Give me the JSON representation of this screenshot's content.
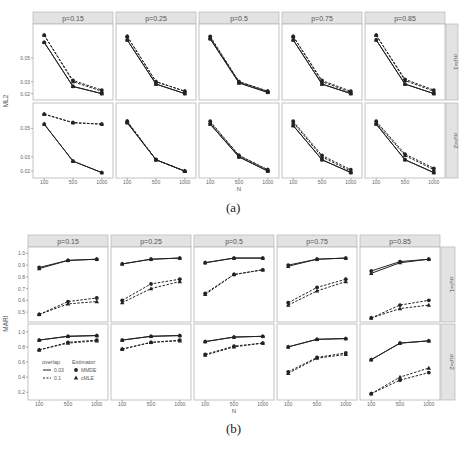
{
  "figure_a": {
    "caption": "(a)",
    "ylabel": "ML2",
    "xlabel": "N",
    "columns": [
      "p=0.15",
      "p=0.25",
      "p=0.5",
      "p=0.75",
      "p=0.85"
    ],
    "rows": [
      "σu²=1",
      "σu²=2"
    ],
    "x_ticks": [
      "100",
      "500",
      "1000"
    ],
    "row_yticks": [
      [
        "0.05",
        "0.03",
        "0.02"
      ],
      [
        "0.05",
        "0.03",
        "0.02"
      ]
    ]
  },
  "figure_b": {
    "caption": "(b)",
    "ylabel": "MARI",
    "xlabel": "N",
    "columns": [
      "p=0.15",
      "p=0.25",
      "p=0.5",
      "p=0.75",
      "p=0.85"
    ],
    "rows": [
      "σu²=1",
      "σu²=2"
    ],
    "x_ticks": [
      "100",
      "500",
      "1000"
    ],
    "row_yticks": [
      [
        "1.0",
        "0.9",
        "0.8",
        "0.7",
        "0.6",
        "0.5"
      ],
      [
        "1.0",
        "0.8",
        "0.6",
        "0.4",
        "0.2"
      ]
    ]
  },
  "legend": {
    "overlap_title": "overlap",
    "overlap_items": [
      {
        "label": "0.03",
        "style": "solid"
      },
      {
        "label": "0.1",
        "style": "dashed"
      }
    ],
    "estimator_title": "Estimator",
    "estimator_items": [
      {
        "label": "MMDE",
        "marker": "circle"
      },
      {
        "label": "cMLE",
        "marker": "triangle"
      }
    ]
  },
  "colors": {
    "strip_bg": "#e3e3e3",
    "strip_border": "#b5b5b5",
    "panel_border": "#b5b5b5",
    "line": "#222222",
    "text": "#444444"
  },
  "chart_data": [
    {
      "type": "line",
      "title": "(a)",
      "xlabel": "N",
      "ylabel": "ML2",
      "x": [
        100,
        500,
        1000
      ],
      "facets_columns": [
        "p=0.15",
        "p=0.25",
        "p=0.5",
        "p=0.75",
        "p=0.85"
      ],
      "facets_rows": [
        "σu²=1",
        "σu²=2"
      ],
      "legend": [
        "overlap 0.03 (solid)",
        "overlap 0.1 (dashed)",
        "MMDE (circle)",
        "cMLE (triangle)"
      ],
      "panels": [
        {
          "row": "σu²=1",
          "col": "p=0.15",
          "ylim": [
            0.018,
            0.075
          ],
          "series": [
            {
              "name": "0.03 MMDE",
              "values": [
                0.063,
                0.026,
                0.02
              ]
            },
            {
              "name": "0.03 cMLE",
              "values": [
                0.063,
                0.026,
                0.02
              ]
            },
            {
              "name": "0.1 MMDE",
              "values": [
                0.069,
                0.031,
                0.023
              ]
            },
            {
              "name": "0.1 cMLE",
              "values": [
                0.069,
                0.03,
                0.022
              ]
            }
          ]
        },
        {
          "row": "σu²=1",
          "col": "p=0.25",
          "ylim": [
            0.018,
            0.075
          ],
          "series": [
            {
              "name": "0.03 MMDE",
              "values": [
                0.065,
                0.028,
                0.02
              ]
            },
            {
              "name": "0.03 cMLE",
              "values": [
                0.065,
                0.028,
                0.02
              ]
            },
            {
              "name": "0.1 MMDE",
              "values": [
                0.068,
                0.03,
                0.022
              ]
            },
            {
              "name": "0.1 cMLE",
              "values": [
                0.068,
                0.03,
                0.022
              ]
            }
          ]
        },
        {
          "row": "σu²=1",
          "col": "p=0.5",
          "ylim": [
            0.018,
            0.075
          ],
          "series": [
            {
              "name": "0.03 MMDE",
              "values": [
                0.066,
                0.029,
                0.021
              ]
            },
            {
              "name": "0.03 cMLE",
              "values": [
                0.066,
                0.029,
                0.021
              ]
            },
            {
              "name": "0.1 MMDE",
              "values": [
                0.068,
                0.03,
                0.022
              ]
            },
            {
              "name": "0.1 cMLE",
              "values": [
                0.067,
                0.03,
                0.022
              ]
            }
          ]
        },
        {
          "row": "σu²=1",
          "col": "p=0.75",
          "ylim": [
            0.018,
            0.075
          ],
          "series": [
            {
              "name": "0.03 MMDE",
              "values": [
                0.065,
                0.028,
                0.02
              ]
            },
            {
              "name": "0.03 cMLE",
              "values": [
                0.065,
                0.028,
                0.02
              ]
            },
            {
              "name": "0.1 MMDE",
              "values": [
                0.068,
                0.031,
                0.022
              ]
            },
            {
              "name": "0.1 cMLE",
              "values": [
                0.068,
                0.03,
                0.021
              ]
            }
          ]
        },
        {
          "row": "σu²=1",
          "col": "p=0.85",
          "ylim": [
            0.018,
            0.075
          ],
          "series": [
            {
              "name": "0.03 MMDE",
              "values": [
                0.065,
                0.028,
                0.02
              ]
            },
            {
              "name": "0.03 cMLE",
              "values": [
                0.065,
                0.028,
                0.02
              ]
            },
            {
              "name": "0.1 MMDE",
              "values": [
                0.069,
                0.032,
                0.023
              ]
            },
            {
              "name": "0.1 cMLE",
              "values": [
                0.069,
                0.031,
                0.022
              ]
            }
          ]
        },
        {
          "row": "σu²=2",
          "col": "p=0.15",
          "ylim": [
            0.018,
            0.065
          ],
          "series": [
            {
              "name": "0.03 MMDE",
              "values": [
                0.053,
                0.027,
                0.019
              ]
            },
            {
              "name": "0.03 cMLE",
              "values": [
                0.053,
                0.027,
                0.019
              ]
            },
            {
              "name": "0.1 MMDE",
              "values": [
                0.06,
                0.054,
                0.053
              ]
            },
            {
              "name": "0.1 cMLE",
              "values": [
                0.06,
                0.054,
                0.053
              ]
            }
          ]
        },
        {
          "row": "σu²=2",
          "col": "p=0.25",
          "ylim": [
            0.018,
            0.065
          ],
          "series": [
            {
              "name": "0.03 MMDE",
              "values": [
                0.054,
                0.028,
                0.02
              ]
            },
            {
              "name": "0.03 cMLE",
              "values": [
                0.054,
                0.028,
                0.02
              ]
            },
            {
              "name": "0.1 MMDE",
              "values": [
                0.055,
                0.028,
                0.02
              ]
            },
            {
              "name": "0.1 cMLE",
              "values": [
                0.055,
                0.028,
                0.02
              ]
            }
          ]
        },
        {
          "row": "σu²=2",
          "col": "p=0.5",
          "ylim": [
            0.018,
            0.065
          ],
          "series": [
            {
              "name": "0.03 MMDE",
              "values": [
                0.053,
                0.03,
                0.02
              ]
            },
            {
              "name": "0.03 cMLE",
              "values": [
                0.053,
                0.03,
                0.02
              ]
            },
            {
              "name": "0.1 MMDE",
              "values": [
                0.055,
                0.031,
                0.021
              ]
            },
            {
              "name": "0.1 cMLE",
              "values": [
                0.054,
                0.031,
                0.021
              ]
            }
          ]
        },
        {
          "row": "σu²=2",
          "col": "p=0.75",
          "ylim": [
            0.018,
            0.065
          ],
          "series": [
            {
              "name": "0.03 MMDE",
              "values": [
                0.052,
                0.028,
                0.019
              ]
            },
            {
              "name": "0.03 cMLE",
              "values": [
                0.052,
                0.028,
                0.019
              ]
            },
            {
              "name": "0.1 MMDE",
              "values": [
                0.055,
                0.031,
                0.021
              ]
            },
            {
              "name": "0.1 cMLE",
              "values": [
                0.054,
                0.03,
                0.02
              ]
            }
          ]
        },
        {
          "row": "σu²=2",
          "col": "p=0.85",
          "ylim": [
            0.018,
            0.065
          ],
          "series": [
            {
              "name": "0.03 MMDE",
              "values": [
                0.053,
                0.028,
                0.019
              ]
            },
            {
              "name": "0.03 cMLE",
              "values": [
                0.053,
                0.028,
                0.019
              ]
            },
            {
              "name": "0.1 MMDE",
              "values": [
                0.055,
                0.032,
                0.022
              ]
            },
            {
              "name": "0.1 cMLE",
              "values": [
                0.054,
                0.031,
                0.021
              ]
            }
          ]
        }
      ]
    },
    {
      "type": "line",
      "title": "(b)",
      "xlabel": "N",
      "ylabel": "MARI",
      "x": [
        100,
        500,
        1000
      ],
      "facets_columns": [
        "p=0.15",
        "p=0.25",
        "p=0.5",
        "p=0.75",
        "p=0.85"
      ],
      "facets_rows": [
        "σu²=1",
        "σu²=2"
      ],
      "legend": [
        "overlap 0.03 (solid)",
        "overlap 0.1 (dashed)",
        "MMDE (circle)",
        "cMLE (triangle)"
      ],
      "panels": [
        {
          "row": "σu²=1",
          "col": "p=0.15",
          "ylim": [
            0.45,
            1.02
          ],
          "series": [
            {
              "name": "0.03 MMDE",
              "values": [
                0.88,
                0.94,
                0.95
              ]
            },
            {
              "name": "0.03 cMLE",
              "values": [
                0.87,
                0.94,
                0.95
              ]
            },
            {
              "name": "0.1 MMDE",
              "values": [
                0.48,
                0.59,
                0.62
              ]
            },
            {
              "name": "0.1 cMLE",
              "values": [
                0.48,
                0.57,
                0.59
              ]
            }
          ]
        },
        {
          "row": "σu²=1",
          "col": "p=0.25",
          "ylim": [
            0.45,
            1.02
          ],
          "series": [
            {
              "name": "0.03 MMDE",
              "values": [
                0.91,
                0.95,
                0.96
              ]
            },
            {
              "name": "0.03 cMLE",
              "values": [
                0.91,
                0.95,
                0.96
              ]
            },
            {
              "name": "0.1 MMDE",
              "values": [
                0.6,
                0.74,
                0.78
              ]
            },
            {
              "name": "0.1 cMLE",
              "values": [
                0.58,
                0.7,
                0.76
              ]
            }
          ]
        },
        {
          "row": "σu²=1",
          "col": "p=0.5",
          "ylim": [
            0.45,
            1.02
          ],
          "series": [
            {
              "name": "0.03 MMDE",
              "values": [
                0.92,
                0.96,
                0.96
              ]
            },
            {
              "name": "0.03 cMLE",
              "values": [
                0.92,
                0.96,
                0.96
              ]
            },
            {
              "name": "0.1 MMDE",
              "values": [
                0.66,
                0.82,
                0.86
              ]
            },
            {
              "name": "0.1 cMLE",
              "values": [
                0.65,
                0.82,
                0.86
              ]
            }
          ]
        },
        {
          "row": "σu²=1",
          "col": "p=0.75",
          "ylim": [
            0.45,
            1.02
          ],
          "series": [
            {
              "name": "0.03 MMDE",
              "values": [
                0.9,
                0.95,
                0.96
              ]
            },
            {
              "name": "0.03 cMLE",
              "values": [
                0.89,
                0.95,
                0.96
              ]
            },
            {
              "name": "0.1 MMDE",
              "values": [
                0.58,
                0.71,
                0.78
              ]
            },
            {
              "name": "0.1 cMLE",
              "values": [
                0.56,
                0.68,
                0.76
              ]
            }
          ]
        },
        {
          "row": "σu²=1",
          "col": "p=0.85",
          "ylim": [
            0.45,
            1.02
          ],
          "series": [
            {
              "name": "0.03 MMDE",
              "values": [
                0.85,
                0.93,
                0.95
              ]
            },
            {
              "name": "0.03 cMLE",
              "values": [
                0.83,
                0.92,
                0.95
              ]
            },
            {
              "name": "0.1 MMDE",
              "values": [
                0.45,
                0.56,
                0.6
              ]
            },
            {
              "name": "0.1 cMLE",
              "values": [
                0.45,
                0.53,
                0.56
              ]
            }
          ]
        },
        {
          "row": "σu²=2",
          "col": "p=0.15",
          "ylim": [
            0.15,
            1.05
          ],
          "series": [
            {
              "name": "0.03 MMDE",
              "values": [
                0.89,
                0.94,
                0.95
              ]
            },
            {
              "name": "0.03 cMLE",
              "values": [
                0.89,
                0.94,
                0.95
              ]
            },
            {
              "name": "0.1 MMDE",
              "values": [
                0.76,
                0.86,
                0.89
              ]
            },
            {
              "name": "0.1 cMLE",
              "values": [
                0.76,
                0.85,
                0.88
              ]
            }
          ]
        },
        {
          "row": "σu²=2",
          "col": "p=0.25",
          "ylim": [
            0.15,
            1.05
          ],
          "series": [
            {
              "name": "0.03 MMDE",
              "values": [
                0.89,
                0.94,
                0.95
              ]
            },
            {
              "name": "0.03 cMLE",
              "values": [
                0.89,
                0.94,
                0.95
              ]
            },
            {
              "name": "0.1 MMDE",
              "values": [
                0.77,
                0.86,
                0.89
              ]
            },
            {
              "name": "0.1 cMLE",
              "values": [
                0.77,
                0.86,
                0.88
              ]
            }
          ]
        },
        {
          "row": "σu²=2",
          "col": "p=0.5",
          "ylim": [
            0.15,
            1.05
          ],
          "series": [
            {
              "name": "0.03 MMDE",
              "values": [
                0.87,
                0.93,
                0.94
              ]
            },
            {
              "name": "0.03 cMLE",
              "values": [
                0.87,
                0.93,
                0.94
              ]
            },
            {
              "name": "0.1 MMDE",
              "values": [
                0.7,
                0.81,
                0.85
              ]
            },
            {
              "name": "0.1 cMLE",
              "values": [
                0.69,
                0.8,
                0.85
              ]
            }
          ]
        },
        {
          "row": "σu²=2",
          "col": "p=0.75",
          "ylim": [
            0.15,
            1.05
          ],
          "series": [
            {
              "name": "0.03 MMDE",
              "values": [
                0.8,
                0.9,
                0.91
              ]
            },
            {
              "name": "0.03 cMLE",
              "values": [
                0.8,
                0.9,
                0.91
              ]
            },
            {
              "name": "0.1 MMDE",
              "values": [
                0.47,
                0.66,
                0.72
              ]
            },
            {
              "name": "0.1 cMLE",
              "values": [
                0.45,
                0.65,
                0.7
              ]
            }
          ]
        },
        {
          "row": "σu²=2",
          "col": "p=0.85",
          "ylim": [
            0.15,
            1.05
          ],
          "series": [
            {
              "name": "0.03 MMDE",
              "values": [
                0.63,
                0.85,
                0.88
              ]
            },
            {
              "name": "0.03 cMLE",
              "values": [
                0.63,
                0.85,
                0.88
              ]
            },
            {
              "name": "0.1 MMDE",
              "values": [
                0.18,
                0.36,
                0.46
              ]
            },
            {
              "name": "0.1 cMLE",
              "values": [
                0.18,
                0.4,
                0.52
              ]
            }
          ]
        }
      ]
    }
  ]
}
